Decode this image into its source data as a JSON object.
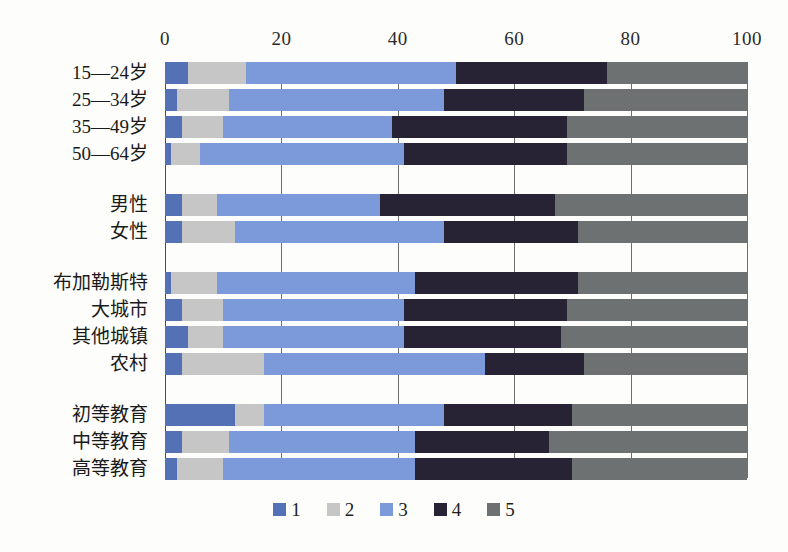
{
  "chart_data": {
    "type": "bar",
    "orientation": "horizontal",
    "stacked": true,
    "normalized_percent": true,
    "title": "",
    "subtitle": "",
    "xlabel": "",
    "ylabel": "",
    "xlim": [
      0,
      100
    ],
    "xticks": [
      "0",
      "20",
      "40",
      "60",
      "80",
      "100"
    ],
    "xtick_values": [
      0,
      20,
      40,
      60,
      80,
      100
    ],
    "grid": true,
    "legend_position": "bottom-center",
    "legend": [
      {
        "label": "1",
        "color": "#5571b5"
      },
      {
        "label": "2",
        "color": "#c6c6c6"
      },
      {
        "label": "3",
        "color": "#7c9ad9"
      },
      {
        "label": "4",
        "color": "#282334"
      },
      {
        "label": "5",
        "color": "#6e7171"
      }
    ],
    "series": [
      {
        "name": "1",
        "color": "#5571b5",
        "values": [
          4,
          2,
          3,
          1,
          3,
          3,
          1,
          3,
          4,
          3,
          12,
          3,
          2
        ]
      },
      {
        "name": "2",
        "color": "#c6c6c6",
        "values": [
          10,
          9,
          7,
          5,
          6,
          9,
          8,
          7,
          6,
          14,
          5,
          8,
          8
        ]
      },
      {
        "name": "3",
        "color": "#7c9ad9",
        "values": [
          36,
          37,
          29,
          35,
          28,
          36,
          34,
          31,
          31,
          38,
          31,
          32,
          33
        ]
      },
      {
        "name": "4",
        "color": "#282334",
        "values": [
          26,
          24,
          30,
          28,
          30,
          23,
          28,
          28,
          27,
          17,
          22,
          23,
          27
        ]
      },
      {
        "name": "5",
        "color": "#6e7171",
        "values": [
          24,
          28,
          31,
          31,
          33,
          29,
          29,
          31,
          32,
          28,
          30,
          34,
          30
        ]
      }
    ],
    "categories": [
      "15—24岁",
      "25—34岁",
      "35—49岁",
      "50—64岁",
      "男性",
      "女性",
      "布加勒斯特",
      "大城市",
      "其他城镇",
      "农村",
      "初等教育",
      "中等教育",
      "高等教育"
    ],
    "group_breaks_after": [
      3,
      5,
      9
    ]
  },
  "colors": {
    "background": "#fdfdfb",
    "grid": "#6e6e6e",
    "axis": "#4a4a4a",
    "text": "#1a1a1a"
  }
}
